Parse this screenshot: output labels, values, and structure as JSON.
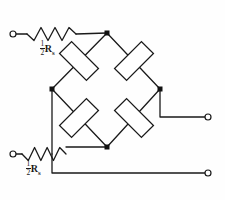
{
  "figure": {
    "name": "wheatstone-bridge-circuit",
    "background_color": "#fefefe",
    "line_color": "#1a1a1a",
    "node_color": "#111111",
    "stroke_width": 1.3
  },
  "labels": {
    "series_resistor_top": {
      "numerator": "1",
      "denominator": "2",
      "symbol": "R",
      "subscript": "s",
      "full_text": "1/2 Rs"
    },
    "series_resistor_bottom": {
      "numerator": "1",
      "denominator": "2",
      "symbol": "R",
      "subscript": "s",
      "full_text": "1/2 Rs"
    }
  },
  "terminals": [
    {
      "id": "terminal-top-left",
      "cx": 13,
      "cy": 34,
      "r": 3.0
    },
    {
      "id": "terminal-bottom-left",
      "cx": 13,
      "cy": 154,
      "r": 3.0
    },
    {
      "id": "terminal-right-middle",
      "cx": 208,
      "cy": 117,
      "r": 3.0
    },
    {
      "id": "terminal-right-bottom",
      "cx": 208,
      "cy": 173,
      "r": 3.0
    }
  ],
  "nodes": [
    {
      "id": "node-top",
      "cx": 107,
      "cy": 33,
      "size": 5.0
    },
    {
      "id": "node-left",
      "cx": 52,
      "cy": 89,
      "size": 5.0
    },
    {
      "id": "node-right",
      "cx": 160,
      "cy": 89,
      "size": 5.0
    },
    {
      "id": "node-bottom",
      "cx": 107,
      "cy": 147,
      "size": 5.0
    }
  ],
  "zigzag_resistors": [
    {
      "id": "resistor-series-top",
      "x1": 27,
      "y1": 34,
      "x2": 76,
      "y2": 34,
      "peaks": 6,
      "amplitude": 6.5
    },
    {
      "id": "resistor-series-bottom",
      "x1": 22,
      "y1": 154,
      "x2": 66,
      "y2": 154,
      "peaks": 6,
      "amplitude": 6.5
    }
  ],
  "box_resistors": [
    {
      "id": "resistor-bridge-top-left",
      "cx": 79,
      "cy": 61,
      "length": 38,
      "width": 17,
      "angle": 45
    },
    {
      "id": "resistor-bridge-top-right",
      "cx": 134,
      "cy": 61,
      "length": 38,
      "width": 17,
      "angle": -45
    },
    {
      "id": "resistor-bridge-bottom-left",
      "cx": 79,
      "cy": 118,
      "length": 38,
      "width": 17,
      "angle": -45
    },
    {
      "id": "resistor-bridge-bottom-right",
      "cx": 134,
      "cy": 118,
      "length": 38,
      "width": 17,
      "angle": 45
    }
  ],
  "wires": [
    {
      "id": "wire-terminal-top-left-to-resistor",
      "points": "16,34 27,34"
    },
    {
      "id": "wire-resistor-to-node-top",
      "points": "76,34 107,33"
    },
    {
      "id": "wire-node-top-to-bridge-left",
      "points": "107,33 52,89"
    },
    {
      "id": "wire-node-top-to-bridge-right",
      "points": "107,33 160,89"
    },
    {
      "id": "wire-node-left-to-bottom",
      "points": "52,89 107,147"
    },
    {
      "id": "wire-node-right-to-bottom",
      "points": "160,89 107,147"
    },
    {
      "id": "wire-node-left-down-to-junction",
      "points": "52,89 52,154"
    },
    {
      "id": "wire-junction-to-node-bottom",
      "points": "66,147 107,147"
    },
    {
      "id": "wire-node-right-down-and-right",
      "points": "160,89 160,117 205,117"
    },
    {
      "id": "wire-junction-down-and-right",
      "points": "52,154 52,173 205,173"
    },
    {
      "id": "wire-terminal-bottom-left-to-resistor",
      "points": "16,154 22,154"
    }
  ]
}
